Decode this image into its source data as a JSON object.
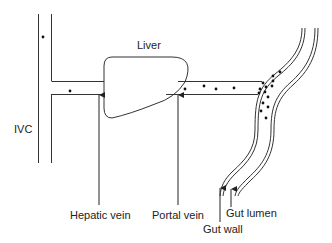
{
  "diagram": {
    "title": "",
    "labels": {
      "liver": "Liver",
      "ivc": "IVC",
      "hepatic_vein": "Hepatic vein",
      "portal_vein": "Portal vein",
      "gut_lumen": "Gut lumen",
      "gut_wall": "Gut wall"
    },
    "colors": {
      "stroke": "#333333",
      "text": "#222222",
      "background": "#ffffff"
    },
    "particles": {
      "ivc_count": 1,
      "hepatic_vein_count": 1,
      "portal_vein_count": 4,
      "gut_count": 14
    }
  }
}
